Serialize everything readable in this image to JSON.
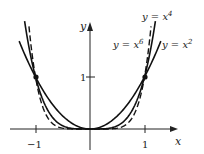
{
  "chart_data": {
    "type": "line",
    "title": "",
    "xlabel": "x",
    "ylabel": "y",
    "x_ticks": [
      -1,
      1
    ],
    "x_tick_labels": [
      "−1",
      "1"
    ],
    "y_ticks": [
      1
    ],
    "y_tick_labels": [
      "1"
    ],
    "xlim": [
      -1.65,
      1.65
    ],
    "ylim": [
      -0.15,
      2.0
    ],
    "grid": false,
    "legend": "inline labels near curves",
    "series": [
      {
        "name": "y = x^2",
        "function": "x^2",
        "style": "solid",
        "x": [
          -1.25,
          -1,
          -0.5,
          0,
          0.5,
          1,
          1.25
        ],
        "y": [
          1.5625,
          1,
          0.25,
          0,
          0.25,
          1,
          1.5625
        ]
      },
      {
        "name": "y = x^4",
        "function": "x^4",
        "style": "solid",
        "x": [
          -1.2,
          -1,
          -0.5,
          0,
          0.5,
          1,
          1.2
        ],
        "y": [
          2.0736,
          1,
          0.0625,
          0,
          0.0625,
          1,
          2.0736
        ]
      },
      {
        "name": "y = x^6",
        "function": "x^6",
        "style": "dashed",
        "x": [
          -1.12,
          -1,
          -0.5,
          0,
          0.5,
          1,
          1.12
        ],
        "y": [
          1.97,
          1,
          0.0156,
          0,
          0.0156,
          1,
          1.97
        ]
      }
    ],
    "annotations": [
      {
        "text": "y = x^4",
        "position": "top right"
      },
      {
        "text": "y = x^6",
        "position": "right, left of x^2 label"
      },
      {
        "text": "y = x^2",
        "position": "right"
      }
    ],
    "marked_points": [
      [
        -1,
        1
      ],
      [
        1,
        1
      ]
    ]
  },
  "labels": {
    "x_axis": "x",
    "y_axis": "y",
    "tick_neg1": "−1",
    "tick_pos1": "1",
    "tick_y1": "1",
    "curve_x4_prefix": "y = x",
    "curve_x4_exp": "4",
    "curve_x6_prefix": "y = x",
    "curve_x6_exp": "6",
    "curve_x2_prefix": "y = x",
    "curve_x2_exp": "2"
  }
}
